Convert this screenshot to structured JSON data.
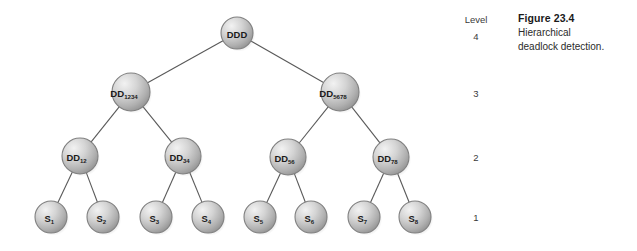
{
  "figure": {
    "caption_title": "Figure 23.4",
    "caption_line1": "Hierarchical",
    "caption_line2": "deadlock detection."
  },
  "levels": {
    "heading": "Level",
    "items": [
      {
        "label": "4",
        "y": 31
      },
      {
        "label": "3",
        "y": 88
      },
      {
        "label": "2",
        "y": 152
      },
      {
        "label": "1",
        "y": 212
      }
    ]
  },
  "colors": {
    "node_fill_light": "#f0f0f0",
    "node_fill_mid": "#c8c8c8",
    "node_fill_dark": "#9a9a9a",
    "node_stroke": "#808080",
    "edge_stroke": "#595959",
    "background": "#ffffff",
    "text": "#1a1a1a"
  },
  "chart_data": {
    "type": "diagram",
    "title": "Hierarchical deadlock detection",
    "nodes": [
      {
        "id": "ddd",
        "base": "DDD",
        "sub": "",
        "level": 4,
        "cx": 237,
        "cy": 33,
        "r": 16
      },
      {
        "id": "dd1234",
        "base": "DD",
        "sub": "1234",
        "level": 3,
        "cx": 131,
        "cy": 92,
        "r": 19
      },
      {
        "id": "dd5678",
        "base": "DD",
        "sub": "5678",
        "level": 3,
        "cx": 340,
        "cy": 92,
        "r": 19
      },
      {
        "id": "dd12",
        "base": "DD",
        "sub": "12",
        "level": 2,
        "cx": 80,
        "cy": 156,
        "r": 18
      },
      {
        "id": "dd34",
        "base": "DD",
        "sub": "34",
        "level": 2,
        "cx": 183,
        "cy": 156,
        "r": 18
      },
      {
        "id": "dd56",
        "base": "DD",
        "sub": "56",
        "level": 2,
        "cx": 288,
        "cy": 157,
        "r": 18
      },
      {
        "id": "dd78",
        "base": "DD",
        "sub": "78",
        "level": 2,
        "cx": 391,
        "cy": 157,
        "r": 18
      },
      {
        "id": "s1",
        "base": "S",
        "sub": "1",
        "level": 1,
        "cx": 51,
        "cy": 217,
        "r": 16
      },
      {
        "id": "s2",
        "base": "S",
        "sub": "2",
        "level": 1,
        "cx": 103,
        "cy": 217,
        "r": 16
      },
      {
        "id": "s3",
        "base": "S",
        "sub": "3",
        "level": 1,
        "cx": 156,
        "cy": 217,
        "r": 16
      },
      {
        "id": "s4",
        "base": "S",
        "sub": "4",
        "level": 1,
        "cx": 208,
        "cy": 217,
        "r": 16
      },
      {
        "id": "s5",
        "base": "S",
        "sub": "5",
        "level": 1,
        "cx": 260,
        "cy": 217,
        "r": 16
      },
      {
        "id": "s6",
        "base": "S",
        "sub": "6",
        "level": 1,
        "cx": 311,
        "cy": 217,
        "r": 16
      },
      {
        "id": "s7",
        "base": "S",
        "sub": "7",
        "level": 1,
        "cx": 364,
        "cy": 217,
        "r": 16
      },
      {
        "id": "s8",
        "base": "S",
        "sub": "8",
        "level": 1,
        "cx": 415,
        "cy": 217,
        "r": 16
      }
    ],
    "edges": [
      {
        "from": "ddd",
        "to": "dd1234"
      },
      {
        "from": "ddd",
        "to": "dd5678"
      },
      {
        "from": "dd1234",
        "to": "dd12"
      },
      {
        "from": "dd1234",
        "to": "dd34"
      },
      {
        "from": "dd5678",
        "to": "dd56"
      },
      {
        "from": "dd5678",
        "to": "dd78"
      },
      {
        "from": "dd12",
        "to": "s1"
      },
      {
        "from": "dd12",
        "to": "s2"
      },
      {
        "from": "dd34",
        "to": "s3"
      },
      {
        "from": "dd34",
        "to": "s4"
      },
      {
        "from": "dd56",
        "to": "s5"
      },
      {
        "from": "dd56",
        "to": "s6"
      },
      {
        "from": "dd78",
        "to": "s7"
      },
      {
        "from": "dd78",
        "to": "s8"
      }
    ]
  }
}
